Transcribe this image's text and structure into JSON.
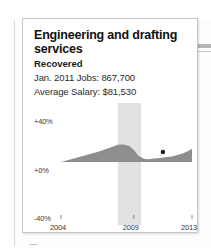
{
  "background": {
    "note": "blurred newspaper page behind card"
  },
  "card": {
    "title": "Engineering and drafting services",
    "status": "Recovered",
    "jobs_line": "Jan. 2011 Jobs: 867,700",
    "salary_line": "Average Salary: $81,530"
  },
  "chart_data": {
    "type": "area",
    "title": "Engineering and drafting services",
    "xlabel": "",
    "ylabel": "",
    "ylim": [
      -40,
      40
    ],
    "ytick_labels": [
      "+40%",
      "+0%",
      "-40%"
    ],
    "ytick_values": [
      40,
      0,
      -40
    ],
    "xtick_labels": [
      "2004",
      "2009",
      "2013"
    ],
    "xtick_values": [
      2004,
      2009,
      2013
    ],
    "grid": false,
    "legend": "none",
    "series_name": "Percent change in jobs",
    "area_color": "#8c8c8c",
    "band_color": "#e2e2e2",
    "recession_band": {
      "label": "recession",
      "start": 2007.9,
      "end": 2009.5
    },
    "marker": {
      "label": "Jan. 2011",
      "x": 2011.0,
      "y": 4.5
    },
    "x": [
      2004.0,
      2004.5,
      2005.0,
      2005.5,
      2006.0,
      2006.5,
      2007.0,
      2007.4,
      2007.9,
      2008.3,
      2008.7,
      2009.0,
      2009.3,
      2009.7,
      2010.0,
      2010.4,
      2010.8,
      2011.2,
      2011.6,
      2012.0,
      2012.4,
      2012.8,
      2013.0
    ],
    "values": [
      0.0,
      1.5,
      3.0,
      4.5,
      6.0,
      7.5,
      9.5,
      11.0,
      13.0,
      13.2,
      12.0,
      9.0,
      5.0,
      2.5,
      2.0,
      2.6,
      3.0,
      3.6,
      4.2,
      5.2,
      6.6,
      8.6,
      10.0
    ]
  }
}
